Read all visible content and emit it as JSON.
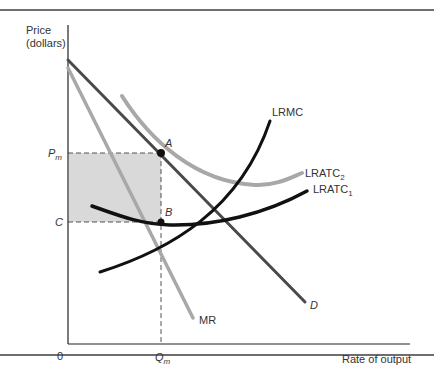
{
  "figure": {
    "y_axis_label_line1": "Price",
    "y_axis_label_line2": "(dollars)",
    "x_axis_label": "Rate of output",
    "origin_label": "0",
    "price_monopoly_label": "P",
    "price_monopoly_sub": "m",
    "cost_label": "C",
    "quantity_label": "Q",
    "quantity_sub": "m",
    "point_a_label": "A",
    "point_b_label": "B",
    "curves": {
      "demand": "D",
      "marginal_revenue": "MR",
      "lrmc": "LRMC",
      "lratc2_base": "LRATC",
      "lratc2_sub": "2",
      "lratc1_base": "LRATC",
      "lratc1_sub": "1"
    },
    "colors": {
      "demand": "#4a4a4a",
      "mr": "#a8a8a8",
      "lratc2": "#a8a8a8",
      "lratc1": "#111111",
      "lrmc": "#111111",
      "profit_area": "#d9d9d9",
      "axes": "#222222"
    }
  }
}
